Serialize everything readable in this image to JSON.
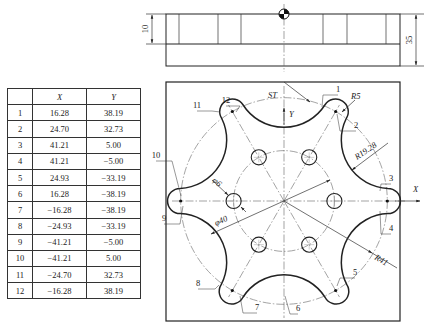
{
  "table": {
    "headers": [
      "",
      "X",
      "Y"
    ],
    "rows": [
      {
        "id": "1",
        "x": "16.28",
        "y": "38.19"
      },
      {
        "id": "2",
        "x": "24.70",
        "y": "32.73"
      },
      {
        "id": "3",
        "x": "41.21",
        "y": "5.00"
      },
      {
        "id": "4",
        "x": "41.21",
        "y": "−5.00"
      },
      {
        "id": "5",
        "x": "24.93",
        "y": "−33.19"
      },
      {
        "id": "6",
        "x": "16.28",
        "y": "−38.19"
      },
      {
        "id": "7",
        "x": "−16.28",
        "y": "−38.19"
      },
      {
        "id": "8",
        "x": "−24.93",
        "y": "−33.19"
      },
      {
        "id": "9",
        "x": "−41.21",
        "y": "−5.00"
      },
      {
        "id": "10",
        "x": "−41.21",
        "y": "5.00"
      },
      {
        "id": "11",
        "x": "−24.70",
        "y": "32.73"
      },
      {
        "id": "12",
        "x": "−16.28",
        "y": "38.19"
      }
    ]
  },
  "side_view": {
    "dim_left": "10",
    "dim_right": "35"
  },
  "plan_view": {
    "start_label": "ST",
    "axis_x": "X",
    "axis_y": "Y",
    "dim_R5": "R5",
    "dim_R19": "R19.28",
    "dim_R41": "R41",
    "dim_hole": "φ6",
    "dim_pcd": "φ40",
    "point_labels": [
      "1",
      "2",
      "3",
      "4",
      "5",
      "6",
      "7",
      "8",
      "9",
      "10",
      "11",
      "12"
    ]
  },
  "geometry_mm": {
    "lobe_center_radius": 41,
    "lobe_radius": 5,
    "concave_radius": 19.28,
    "hole_diameter": 6,
    "hole_pcd": 40,
    "hole_count": 6,
    "lobe_count": 6,
    "depth_total": 35,
    "depth_step": 10
  }
}
